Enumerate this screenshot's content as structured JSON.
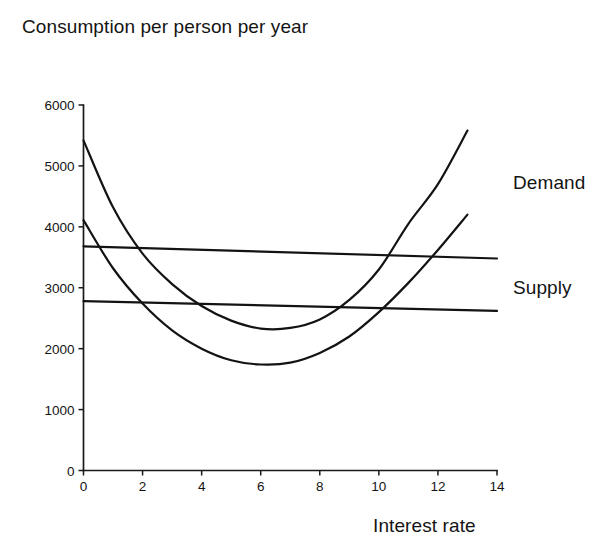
{
  "chart_data": {
    "type": "line",
    "title": "Consumption per person per year",
    "title_line1": "Consumption per",
    "title_line2": "person per year",
    "xlabel": "Interest rate",
    "ylabel": "Consumption per person per year",
    "xlim": [
      0,
      14
    ],
    "ylim": [
      0,
      6000
    ],
    "xticks": [
      0,
      2,
      4,
      6,
      8,
      10,
      12,
      14
    ],
    "yticks": [
      0,
      1000,
      2000,
      3000,
      4000,
      5000,
      6000
    ],
    "xtick_labels": [
      "0",
      "2",
      "4",
      "6",
      "8",
      "10",
      "12",
      "14"
    ],
    "ytick_labels": [
      "0",
      "1000",
      "2000",
      "3000",
      "4000",
      "5000",
      "6000"
    ],
    "grid": false,
    "legend_position": "right-inline",
    "line_color": "#131313",
    "series": [
      {
        "name": "Demand",
        "label_shown": "Demand",
        "description": "U-shaped curve, highest starting value",
        "x": [
          0,
          1,
          2,
          3,
          4,
          5,
          6,
          7,
          8,
          9,
          10,
          11,
          12,
          13
        ],
        "values": [
          5420,
          4320,
          3560,
          3060,
          2700,
          2460,
          2330,
          2340,
          2480,
          2800,
          3300,
          4050,
          4700,
          5580
        ]
      },
      {
        "name": "Supply",
        "label_shown": "Supply",
        "description": "U-shaped curve, lower starting value",
        "x": [
          0,
          1,
          2,
          3,
          4,
          5,
          6,
          7,
          8,
          9,
          10,
          11,
          12,
          13
        ],
        "values": [
          4110,
          3320,
          2740,
          2300,
          2000,
          1810,
          1740,
          1770,
          1930,
          2200,
          2600,
          3080,
          3620,
          4200
        ]
      },
      {
        "name": "Flat upper line",
        "label_shown": "",
        "description": "Nearly horizontal line declining slightly",
        "x": [
          0,
          14
        ],
        "values": [
          3680,
          3480
        ]
      },
      {
        "name": "Flat lower line",
        "label_shown": "",
        "description": "Nearly horizontal line declining slightly",
        "x": [
          0,
          14
        ],
        "values": [
          2780,
          2620
        ]
      }
    ]
  },
  "labels": {
    "demand": "Demand",
    "supply": "Supply"
  }
}
